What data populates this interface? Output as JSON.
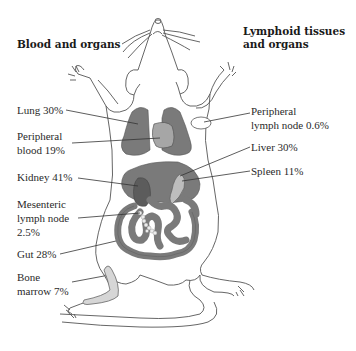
{
  "headers": {
    "left": "Blood and organs",
    "right_line1": "Lymphoid tissues",
    "right_line2": "and organs"
  },
  "labels": {
    "lung": {
      "line1": "Lung 30%"
    },
    "peripheral_blood": {
      "line1": "Peripheral",
      "line2": "blood 19%"
    },
    "kidney": {
      "line1": "Kidney 41%"
    },
    "mesenteric_lymph_node": {
      "line1": "Mesenteric",
      "line2": "lymph node",
      "line3": "2.5%"
    },
    "gut": {
      "line1": "Gut 28%"
    },
    "bone_marrow": {
      "line1": "Bone",
      "line2": "marrow 7%"
    },
    "peripheral_lymph_node": {
      "line1": "Peripheral",
      "line2": "lymph node 0.6%"
    },
    "liver": {
      "line1": "Liver 30%"
    },
    "spleen": {
      "line1": "Spleen 11%"
    }
  },
  "colors": {
    "outline": "#555555",
    "organ_dark": "#7a7a7a",
    "organ_darker": "#5e5e5e",
    "organ_light": "#a8a8a8",
    "organ_pale": "#d0d0d0",
    "node": "#e8e8e8"
  }
}
